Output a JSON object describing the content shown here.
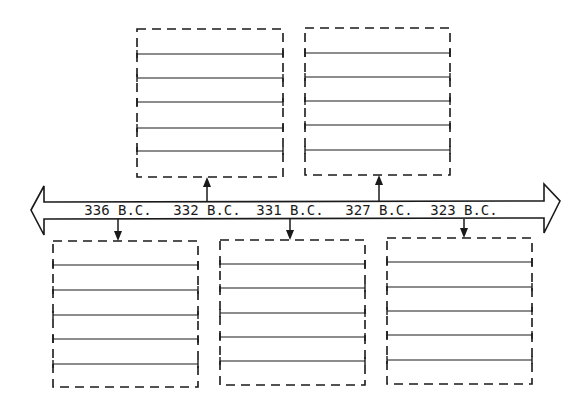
{
  "timeline": {
    "events": [
      {
        "label": "336 B.C.",
        "x": 118,
        "box": "bottom",
        "box_index": 0
      },
      {
        "label": "332 B.C.",
        "x": 207,
        "box": "top",
        "box_index": 0
      },
      {
        "label": "331 B.C.",
        "x": 290,
        "box": "bottom",
        "box_index": 1
      },
      {
        "label": "327 B.C.",
        "x": 379,
        "box": "top",
        "box_index": 1
      },
      {
        "label": "323 B.C.",
        "x": 464,
        "box": "bottom",
        "box_index": 2
      }
    ]
  },
  "boxes": {
    "top": [
      {
        "x": 137,
        "y": 29,
        "w": 146,
        "h": 148,
        "lines": [
          54,
          78,
          102,
          128,
          151
        ]
      },
      {
        "x": 305,
        "y": 28,
        "w": 145,
        "h": 147,
        "lines": [
          53,
          77,
          101,
          125,
          150
        ]
      }
    ],
    "bottom": [
      {
        "x": 53,
        "y": 241,
        "w": 145,
        "h": 146,
        "lines": [
          265,
          290,
          315,
          339,
          364
        ]
      },
      {
        "x": 220,
        "y": 240,
        "w": 145,
        "h": 145,
        "lines": [
          264,
          288,
          313,
          337,
          361
        ]
      },
      {
        "x": 387,
        "y": 238,
        "w": 145,
        "h": 146,
        "lines": [
          262,
          287,
          311,
          335,
          360
        ]
      }
    ]
  },
  "colors": {
    "stroke": "#1a1a1a",
    "background": "#ffffff"
  }
}
